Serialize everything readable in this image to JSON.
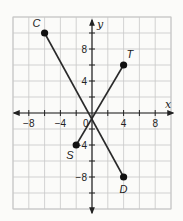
{
  "graph": {
    "x_axis_label": "x",
    "y_axis_label": "y",
    "x_range": [
      -10,
      10
    ],
    "y_range": [
      -12,
      12
    ],
    "grid_step": 2,
    "x_ticks": [
      {
        "value": -8,
        "label": "−8"
      },
      {
        "value": -4,
        "label": "−4"
      },
      {
        "value": 4,
        "label": "4"
      },
      {
        "value": 8,
        "label": "8"
      }
    ],
    "y_ticks": [
      {
        "value": 8,
        "label": "8"
      },
      {
        "value": 4,
        "label": "4"
      },
      {
        "value": -4,
        "label": "−4"
      },
      {
        "value": -8,
        "label": "−8"
      }
    ],
    "origin_label": "0",
    "points": [
      {
        "name": "C",
        "x": -6,
        "y": 10
      },
      {
        "name": "T",
        "x": 4,
        "y": 6
      },
      {
        "name": "S",
        "x": -2,
        "y": -4
      },
      {
        "name": "D",
        "x": 4,
        "y": -8
      }
    ],
    "segments": [
      {
        "from": "C",
        "to": "D"
      },
      {
        "from": "S",
        "to": "T"
      }
    ],
    "colors": {
      "grid": "#c8c8c8",
      "axis": "#222222",
      "segment": "#2a2a2a",
      "point": "#111111",
      "background": "#fbfbf9"
    }
  }
}
